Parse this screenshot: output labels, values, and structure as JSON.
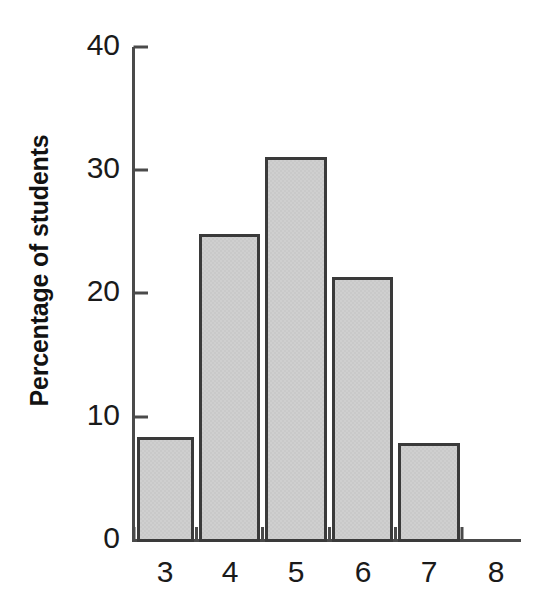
{
  "chart_data": {
    "type": "bar",
    "title": "",
    "subtitle": "",
    "xlabel": "",
    "ylabel": "Percentage of students",
    "categories": [
      "3",
      "4",
      "5",
      "6",
      "7"
    ],
    "values": [
      8.3,
      24.7,
      31.0,
      21.2,
      7.8
    ],
    "x_tick_labels": [
      "3",
      "4",
      "5",
      "6",
      "7",
      "8"
    ],
    "y_tick_labels": [
      "0",
      "10",
      "20",
      "30",
      "40"
    ],
    "y_ticks": [
      0,
      10,
      20,
      30,
      40
    ],
    "ylim": [
      0,
      40
    ],
    "grid": false,
    "legend": null,
    "bar_fill_color": "#c9c9c9",
    "bar_edge_color": "#3a3a3a",
    "axis_color": "#4a4a4a",
    "text_color": "#1a1a1a",
    "background_color": "#ffffff",
    "annotations": []
  },
  "axis": {
    "y_title": "Percentage of students"
  }
}
